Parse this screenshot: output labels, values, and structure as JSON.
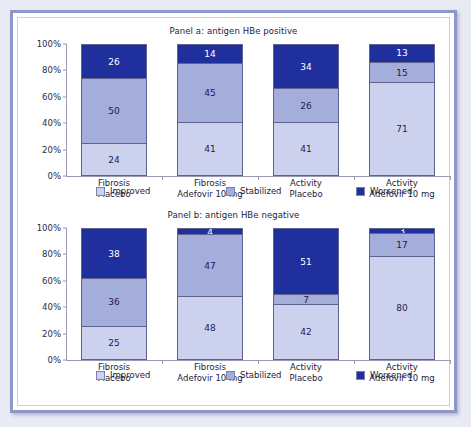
{
  "legend": {
    "items": [
      {
        "label": "Improved",
        "key": "improved",
        "color": "#ccd2ee"
      },
      {
        "label": "Stabilized",
        "key": "stabilized",
        "color": "#a5adda"
      },
      {
        "label": "Worsened",
        "key": "worsened",
        "color": "#1f2f9e"
      }
    ]
  },
  "axis": {
    "yticks": [
      "0%",
      "20%",
      "40%",
      "60%",
      "80%",
      "100%"
    ]
  },
  "chart_data": [
    {
      "type": "bar",
      "title": "Panel a: antigen HBe positive",
      "stacked": true,
      "xlabel": "",
      "ylabel": "",
      "ylim": [
        0,
        100
      ],
      "grid": false,
      "legend_position": "bottom",
      "categories": [
        "Fibrosis\nPlacebo",
        "Fibrosis\nAdefovir 10 mg",
        "Activity\nPlacebo",
        "Activity\nAdefovir 10 mg"
      ],
      "category_lines": [
        [
          "Fibrosis",
          "Placebo"
        ],
        [
          "Fibrosis",
          "Adefovir 10 mg"
        ],
        [
          "Activity",
          "Placebo"
        ],
        [
          "Activity",
          "Adefovir 10 mg"
        ]
      ],
      "yticks": [
        "0%",
        "20%",
        "40%",
        "60%",
        "80%",
        "100%"
      ],
      "series": [
        {
          "name": "Improved",
          "values": [
            24,
            41,
            41,
            71
          ]
        },
        {
          "name": "Stabilized",
          "values": [
            50,
            45,
            26,
            15
          ]
        },
        {
          "name": "Worsened",
          "values": [
            26,
            14,
            34,
            13
          ]
        }
      ]
    },
    {
      "type": "bar",
      "title": "Panel b: antigen HBe negative",
      "stacked": true,
      "xlabel": "",
      "ylabel": "",
      "ylim": [
        0,
        100
      ],
      "grid": false,
      "legend_position": "bottom",
      "categories": [
        "Fibrosis\nPlacebo",
        "Fibrosis\nAdefovir 10 mg",
        "Activity\nPlacebo",
        "Activity\nAdefovir 10 mg"
      ],
      "category_lines": [
        [
          "Fibrosis",
          "Placebo"
        ],
        [
          "Fibrosis",
          "Adefovir 10 mg"
        ],
        [
          "Activity",
          "Placebo"
        ],
        [
          "Activity",
          "Adefovir 10 mg"
        ]
      ],
      "yticks": [
        "0%",
        "20%",
        "40%",
        "60%",
        "80%",
        "100%"
      ],
      "series": [
        {
          "name": "Improved",
          "values": [
            25,
            48,
            42,
            80
          ]
        },
        {
          "name": "Stabilized",
          "values": [
            36,
            47,
            7,
            17
          ]
        },
        {
          "name": "Worsened",
          "values": [
            38,
            4,
            51,
            3
          ]
        }
      ]
    }
  ]
}
